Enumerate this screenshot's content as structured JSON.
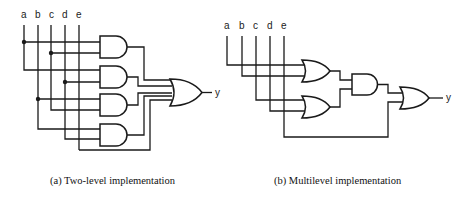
{
  "diagram_a": {
    "inputs": [
      "a",
      "b",
      "c",
      "d",
      "e"
    ],
    "output": "y",
    "caption": "(a) Two-level implementation",
    "gates": [
      "AND",
      "AND",
      "AND",
      "AND",
      "OR"
    ]
  },
  "diagram_b": {
    "inputs": [
      "a",
      "b",
      "c",
      "d",
      "e"
    ],
    "output": "y",
    "caption": "(b) Multilevel implementation",
    "gates": [
      "OR",
      "OR",
      "AND",
      "OR"
    ]
  }
}
